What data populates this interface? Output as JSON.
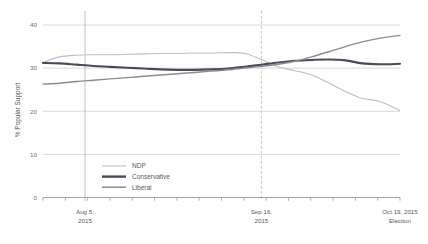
{
  "chart_data": {
    "type": "line",
    "title": "",
    "subtitle": "",
    "xlabel": "",
    "ylabel": "% Popular Support",
    "ylim": [
      0,
      40
    ],
    "yticks": [
      0,
      10,
      20,
      30,
      40
    ],
    "ytick_labels": [
      "0",
      "10",
      "20",
      "30",
      "40"
    ],
    "grid": true,
    "grid_axis": "y",
    "legend_position": "inside-lower-left",
    "x_axis_type": "date",
    "xlim": [
      "2015-07-26",
      "2015-10-19"
    ],
    "x_annotations": [
      {
        "id": "aug5",
        "label_line1": "Aug 5,",
        "label_line2": "2015",
        "x": "2015-08-05",
        "marker": "solid-vertical-line"
      },
      {
        "id": "sep16",
        "label_line1": "Sep 16,",
        "label_line2": "2015",
        "x": "2015-09-16",
        "marker": "dashed-vertical-line"
      },
      {
        "id": "oct19",
        "label_line1": "Oct 19, 2015",
        "label_line2": "Election",
        "x": "2015-10-19",
        "marker": "none"
      }
    ],
    "series": [
      {
        "name": "NDP",
        "color": "#bfbfbf",
        "width": 1.1,
        "x": [
          0,
          4,
          8,
          12,
          16,
          20,
          24,
          28,
          32,
          36,
          40,
          44,
          48,
          52,
          56,
          60,
          64,
          68,
          72,
          76,
          80,
          85
        ],
        "values": [
          31.3,
          32.6,
          33.0,
          33.1,
          33.1,
          33.2,
          33.3,
          33.4,
          33.4,
          33.5,
          33.5,
          33.6,
          33.4,
          32.0,
          30.3,
          29.4,
          28.4,
          26.6,
          24.6,
          23.0,
          22.3,
          20.2
        ]
      },
      {
        "name": "Conservative",
        "color": "#4a4a5a",
        "width": 2.1,
        "x": [
          0,
          4,
          8,
          12,
          16,
          20,
          24,
          28,
          32,
          36,
          40,
          44,
          48,
          52,
          56,
          60,
          64,
          68,
          72,
          76,
          80,
          85
        ],
        "values": [
          31.2,
          31.1,
          30.8,
          30.5,
          30.3,
          30.1,
          29.9,
          29.7,
          29.6,
          29.6,
          29.7,
          29.9,
          30.3,
          30.8,
          31.3,
          31.7,
          31.9,
          32.0,
          31.8,
          31.1,
          30.9,
          31.0
        ]
      },
      {
        "name": "Liberal",
        "color": "#8c8c90",
        "width": 1.4,
        "x": [
          0,
          4,
          8,
          12,
          16,
          20,
          24,
          28,
          32,
          36,
          40,
          44,
          48,
          52,
          56,
          60,
          64,
          68,
          72,
          76,
          80,
          85
        ],
        "values": [
          26.3,
          26.5,
          26.9,
          27.2,
          27.5,
          27.8,
          28.1,
          28.4,
          28.7,
          29.0,
          29.3,
          29.6,
          30.0,
          30.4,
          30.9,
          31.6,
          32.6,
          33.8,
          35.0,
          36.1,
          36.9,
          37.6
        ]
      }
    ],
    "legend": [
      {
        "name": "NDP",
        "color": "#bfbfbf",
        "width": 1.1
      },
      {
        "name": "Conservative",
        "color": "#4a4a5a",
        "width": 2.4
      },
      {
        "name": "Liberal",
        "color": "#8c8c90",
        "width": 1.5
      }
    ],
    "colors": {
      "ndp": "#bfbfbf",
      "conservative": "#4a4a5a",
      "liberal": "#8c8c90",
      "gridline": "#c9c9cc",
      "axis": "#9a9a9d",
      "annotation_line": "#b0b0b3",
      "text": "#58585a",
      "background": "#ffffff"
    }
  }
}
